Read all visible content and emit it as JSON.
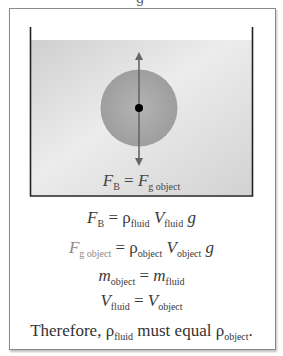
{
  "figure": {
    "cutoff_top_text": "g",
    "diagram": {
      "container": "beaker",
      "fluid_color": "#d8d8d8",
      "object_shape": "sphere",
      "object_color": "#a9a9a9",
      "arrow_color": "#6b6b6b",
      "center_dot_color": "#000000",
      "label": {
        "lhs": "F",
        "lhs_sub": "B",
        "op": "=",
        "rhs": "F",
        "rhs_sub": "g object"
      }
    },
    "equations": [
      {
        "lhs": "F",
        "lhs_sub": "B",
        "op": "=",
        "terms": [
          {
            "sym": "ρ",
            "sub": "fluid"
          },
          {
            "sym": "V",
            "sub": "fluid"
          },
          {
            "sym": "g",
            "sub": ""
          }
        ]
      },
      {
        "lhs": "F",
        "lhs_sub": "g object",
        "op": "=",
        "terms": [
          {
            "sym": "ρ",
            "sub": "object"
          },
          {
            "sym": "V",
            "sub": "object"
          },
          {
            "sym": "g",
            "sub": ""
          }
        ]
      },
      {
        "lhs": "m",
        "lhs_sub": "object",
        "op": "=",
        "terms": [
          {
            "sym": "m",
            "sub": "fluid"
          }
        ]
      },
      {
        "lhs": "V",
        "lhs_sub": "fluid",
        "op": "=",
        "terms": [
          {
            "sym": "V",
            "sub": "object"
          }
        ]
      }
    ],
    "conclusion": {
      "prefix": "Therefore, ",
      "sym1": "ρ",
      "sub1": "fluid",
      "middle": " must equal ",
      "sym2": "ρ",
      "sub2": "object",
      "suffix": "."
    }
  }
}
